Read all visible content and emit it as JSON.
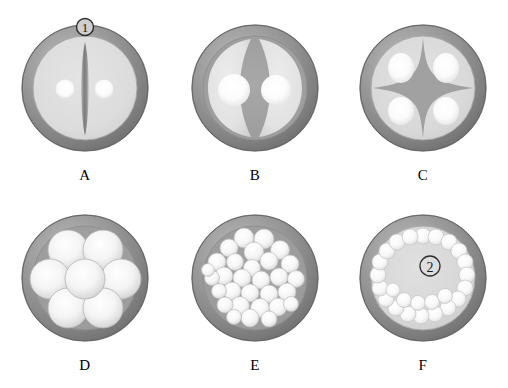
{
  "figure": {
    "background_color": "#ffffff",
    "ring_color": "#8a8a8a",
    "ring_dark_color": "#6d6d6d",
    "ring_light_color": "#b9b9b9",
    "interior_color": "#d9d9d9",
    "lobe_color": "#e6e6e6",
    "highlight_color": "#ffffff",
    "divider_color": "#9a9a9a",
    "label_color": "#000000",
    "columns": 3,
    "rows": 2
  },
  "panels": [
    {
      "id": "a",
      "label": "A",
      "name": "panel-a",
      "description": "Circular cross-section with outer ring, light interior, a vertical lens-shaped slit in the center and two white dots flanking it",
      "marker": "①",
      "marker_present": true,
      "marker_position": "top",
      "feature_count": 1,
      "feature_type": "single-slit"
    },
    {
      "id": "b",
      "label": "B",
      "name": "panel-b",
      "description": "Circular cross-section divided into two large lobes, each containing a white circular highlight",
      "marker": "",
      "marker_present": false,
      "marker_position": "",
      "feature_count": 2,
      "feature_type": "two-lobes"
    },
    {
      "id": "c",
      "label": "C",
      "name": "panel-c",
      "description": "Circular cross-section divided into four quadrant lobes by a four-pointed star divider, each lobe with a white highlight",
      "marker": "",
      "marker_present": false,
      "marker_position": "",
      "feature_count": 4,
      "feature_type": "four-lobes"
    },
    {
      "id": "d",
      "label": "D",
      "name": "panel-d",
      "description": "Circular cross-section filled with seven large circles, six arranged around one central circle",
      "marker": "",
      "marker_present": false,
      "marker_position": "",
      "feature_count": 7,
      "feature_type": "seven-circles"
    },
    {
      "id": "e",
      "label": "E",
      "name": "panel-e",
      "description": "Circular cross-section densely packed with about thirty small white circles",
      "marker": "",
      "marker_present": false,
      "marker_position": "",
      "feature_count": 30,
      "feature_type": "many-small-circles"
    },
    {
      "id": "f",
      "label": "F",
      "name": "panel-f",
      "description": "Circular cross-section with a peripheral ring of small circles surrounding a light gray center bearing a circled numeral two",
      "marker": "②",
      "marker_present": true,
      "marker_position": "center",
      "feature_count": 22,
      "feature_type": "peripheral-ring"
    }
  ]
}
